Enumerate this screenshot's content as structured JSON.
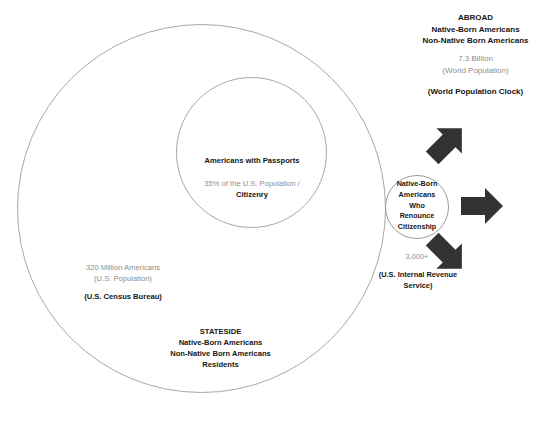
{
  "diagram": {
    "colors": {
      "circle_stroke": "#a8a8a8",
      "arrow_fill": "#333333",
      "text_dark": "#161616",
      "text_gray": "#8d8d8d",
      "background": "#ffffff"
    },
    "abroad": {
      "heading": "ABROAD",
      "line1": "Native-Born Americans",
      "line2": "Non-Native Born Americans",
      "population_value": "7.3 Billion",
      "population_label": "(World Population)",
      "source": "(World Population Clock)"
    },
    "passports": {
      "title": "Americans with Passports",
      "stat_line1": "35% of the U.S. Population /",
      "stat_line2": "Citizenry"
    },
    "us_population": {
      "value": "320 Million Americans",
      "label": "(U.S. Population)",
      "source": "(U.S. Census Bureau)"
    },
    "stateside": {
      "heading": "STATESIDE",
      "line1": "Native-Born Americans",
      "line2": "Non-Native Born Americans",
      "line3": "Residents"
    },
    "renounce": {
      "line1": "Native-Born",
      "line2": "Americans",
      "line3": "Who",
      "line4": "Renounce",
      "line5": "Citizenship",
      "count": "3,000+",
      "source": "(U.S. Internal Revenue Service)"
    },
    "arrows": [
      {
        "name": "arrow-up-right-icon",
        "direction": "up-right"
      },
      {
        "name": "arrow-right-icon",
        "direction": "right"
      },
      {
        "name": "arrow-down-right-icon",
        "direction": "down-right"
      }
    ]
  }
}
